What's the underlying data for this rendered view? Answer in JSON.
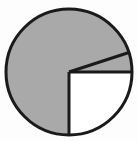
{
  "chart_data": {
    "type": "pie",
    "title": "",
    "subtitle": "",
    "xlabel": "",
    "ylabel": "",
    "grid": false,
    "legend_position": "none",
    "labels": [
      "Slice A",
      "Slice B",
      "Slice C"
    ],
    "values": [
      75,
      5,
      20
    ],
    "units": "percent",
    "start_angle_deg": 180,
    "direction": "clockwise",
    "slice_colors": [
      "#a9a9a9",
      "#ffffff",
      "#ffffff"
    ],
    "slice_boundaries_deg": [
      180,
      90,
      72
    ],
    "annotations": [],
    "tick_labels": [],
    "data_labels_visible": false
  },
  "figure": {
    "background_color": "#fdfdfd",
    "outline_color": "#1a1a1a",
    "outline_width_px": 3,
    "center_x": 69,
    "center_y": 72,
    "radius_px": 63
  },
  "accessibility": {
    "alt_text": "Pie chart with one large gray slice and two white slices"
  }
}
